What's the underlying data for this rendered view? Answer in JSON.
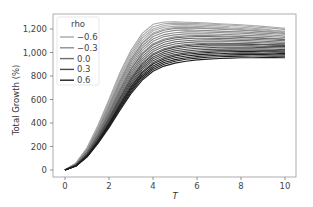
{
  "chart_data": {
    "type": "line",
    "title": "",
    "xlabel": "T",
    "ylabel": "Total Growth (%)",
    "xlim": [
      -0.45,
      10.45
    ],
    "ylim": [
      -60,
      1340
    ],
    "xticks": [
      0,
      2,
      4,
      6,
      8,
      10
    ],
    "xtick_labels": [
      "0",
      "2",
      "4",
      "6",
      "8",
      "10"
    ],
    "yticks": [
      0,
      200,
      400,
      600,
      800,
      1000,
      1200
    ],
    "ytick_labels": [
      "0",
      "200",
      "400",
      "600",
      "800",
      "1,000",
      "1,200"
    ],
    "grid": false,
    "legend": {
      "title": "rho",
      "position": "upper left",
      "entries": [
        "−0.6",
        "−0.3",
        "0.0",
        "0.3",
        "0.6"
      ]
    },
    "x": [
      0,
      0.5,
      1,
      1.5,
      2,
      2.5,
      3,
      3.5,
      4,
      4.5,
      5,
      5.5,
      6,
      6.5,
      7,
      7.5,
      8,
      8.5,
      9,
      9.5,
      10
    ],
    "series": [
      {
        "name": "−0.6",
        "color": "#a8a8a8",
        "runs": [
          [
            0,
            60,
            190,
            380,
            600,
            830,
            1020,
            1160,
            1240,
            1260,
            1262,
            1258,
            1255,
            1250,
            1245,
            1240,
            1236,
            1230,
            1222,
            1215,
            1205
          ],
          [
            0,
            58,
            185,
            370,
            585,
            810,
            1000,
            1140,
            1220,
            1245,
            1250,
            1248,
            1246,
            1240,
            1238,
            1232,
            1228,
            1220,
            1212,
            1205,
            1195
          ],
          [
            0,
            55,
            178,
            360,
            570,
            790,
            980,
            1120,
            1200,
            1230,
            1240,
            1238,
            1235,
            1230,
            1226,
            1220,
            1215,
            1208,
            1200,
            1190,
            1180
          ],
          [
            0,
            53,
            172,
            350,
            555,
            770,
            960,
            1100,
            1185,
            1215,
            1225,
            1226,
            1222,
            1218,
            1214,
            1208,
            1204,
            1198,
            1192,
            1184,
            1175
          ],
          [
            0,
            51,
            168,
            340,
            540,
            752,
            940,
            1080,
            1165,
            1200,
            1212,
            1214,
            1212,
            1208,
            1204,
            1200,
            1196,
            1190,
            1183,
            1176,
            1168
          ]
        ]
      },
      {
        "name": "−0.3",
        "color": "#8c8c8c",
        "runs": [
          [
            0,
            52,
            170,
            345,
            545,
            755,
            940,
            1075,
            1155,
            1190,
            1205,
            1208,
            1206,
            1202,
            1198,
            1194,
            1190,
            1184,
            1178,
            1170,
            1162
          ],
          [
            0,
            50,
            165,
            335,
            530,
            735,
            920,
            1055,
            1135,
            1172,
            1188,
            1192,
            1190,
            1186,
            1182,
            1178,
            1175,
            1170,
            1165,
            1160,
            1155
          ],
          [
            0,
            48,
            160,
            325,
            515,
            718,
            900,
            1035,
            1115,
            1152,
            1168,
            1175,
            1176,
            1173,
            1170,
            1166,
            1163,
            1158,
            1152,
            1146,
            1140
          ],
          [
            0,
            47,
            156,
            316,
            502,
            700,
            880,
            1015,
            1095,
            1135,
            1150,
            1158,
            1160,
            1158,
            1155,
            1152,
            1148,
            1144,
            1140,
            1134,
            1128
          ],
          [
            0,
            45,
            152,
            308,
            490,
            684,
            862,
            995,
            1075,
            1115,
            1134,
            1142,
            1145,
            1144,
            1142,
            1138,
            1135,
            1130,
            1126,
            1120,
            1115
          ]
        ]
      },
      {
        "name": "0.0",
        "color": "#6e6e6e",
        "runs": [
          [
            0,
            45,
            150,
            305,
            485,
            678,
            855,
            985,
            1065,
            1105,
            1124,
            1132,
            1136,
            1136,
            1134,
            1132,
            1128,
            1124,
            1120,
            1115,
            1110
          ],
          [
            0,
            44,
            146,
            297,
            473,
            662,
            836,
            965,
            1045,
            1088,
            1108,
            1118,
            1122,
            1122,
            1120,
            1118,
            1115,
            1112,
            1108,
            1104,
            1100
          ],
          [
            0,
            43,
            142,
            290,
            462,
            646,
            818,
            946,
            1026,
            1068,
            1090,
            1100,
            1106,
            1108,
            1107,
            1105,
            1103,
            1100,
            1096,
            1092,
            1088
          ],
          [
            0,
            42,
            139,
            283,
            452,
            632,
            800,
            928,
            1008,
            1050,
            1072,
            1084,
            1090,
            1092,
            1092,
            1091,
            1089,
            1086,
            1083,
            1080,
            1076
          ],
          [
            0,
            41,
            136,
            277,
            442,
            618,
            784,
            910,
            990,
            1032,
            1055,
            1068,
            1075,
            1078,
            1078,
            1077,
            1076,
            1074,
            1071,
            1068,
            1065
          ]
        ]
      },
      {
        "name": "0.3",
        "color": "#4a4a4a",
        "runs": [
          [
            0,
            41,
            135,
            274,
            437,
            612,
            776,
            900,
            980,
            1022,
            1046,
            1058,
            1066,
            1070,
            1072,
            1071,
            1070,
            1068,
            1066,
            1063,
            1060
          ],
          [
            0,
            40,
            132,
            268,
            428,
            600,
            760,
            884,
            962,
            1005,
            1030,
            1044,
            1052,
            1056,
            1058,
            1058,
            1057,
            1056,
            1054,
            1052,
            1050
          ],
          [
            0,
            39,
            129,
            262,
            419,
            587,
            745,
            868,
            946,
            990,
            1014,
            1028,
            1036,
            1041,
            1044,
            1045,
            1045,
            1044,
            1042,
            1040,
            1038
          ],
          [
            0,
            38,
            126,
            257,
            410,
            575,
            731,
            852,
            930,
            974,
            998,
            1012,
            1021,
            1026,
            1029,
            1031,
            1032,
            1031,
            1030,
            1028,
            1025
          ],
          [
            0,
            37,
            123,
            251,
            401,
            563,
            716,
            836,
            914,
            958,
            982,
            997,
            1006,
            1012,
            1016,
            1018,
            1019,
            1019,
            1018,
            1016,
            1014
          ]
        ]
      },
      {
        "name": "0.6",
        "color": "#1e1e1e",
        "runs": [
          [
            0,
            37,
            121,
            247,
            395,
            554,
            705,
            824,
            902,
            945,
            970,
            985,
            994,
            1000,
            1004,
            1007,
            1008,
            1008,
            1007,
            1005,
            1003
          ],
          [
            0,
            36,
            118,
            242,
            386,
            543,
            691,
            808,
            886,
            930,
            955,
            970,
            980,
            986,
            990,
            993,
            995,
            995,
            994,
            993,
            991
          ],
          [
            0,
            35,
            116,
            237,
            378,
            532,
            678,
            794,
            871,
            915,
            940,
            956,
            966,
            973,
            977,
            980,
            982,
            983,
            982,
            981,
            980
          ],
          [
            0,
            34,
            113,
            232,
            370,
            521,
            665,
            779,
            856,
            900,
            926,
            942,
            952,
            959,
            964,
            967,
            969,
            970,
            970,
            969,
            968
          ],
          [
            0,
            33,
            110,
            226,
            361,
            509,
            650,
            763,
            840,
            884,
            910,
            926,
            937,
            944,
            949,
            952,
            955,
            956,
            957,
            957,
            956
          ]
        ]
      }
    ]
  }
}
